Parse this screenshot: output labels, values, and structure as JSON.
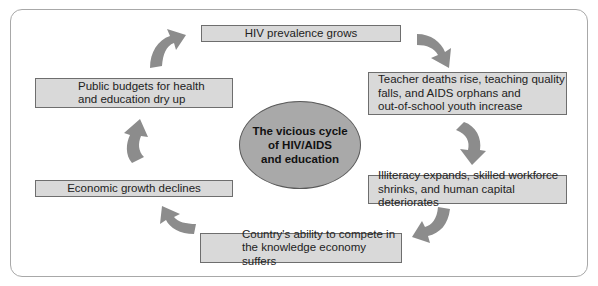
{
  "diagram": {
    "title": "The vicious cycle\nof HIV/AIDS\nand education",
    "colors": {
      "box_fill": "#d9d9d9",
      "box_border": "#6e6e6e",
      "ellipse_fill": "#a9a9a9",
      "arrow_fill": "#8c8c8c",
      "frame_border": "#a8a8a8"
    },
    "nodes": [
      {
        "id": "hiv",
        "text": "HIV prevalence grows"
      },
      {
        "id": "teacher",
        "text": "Teacher deaths rise, teaching quality\nfalls, and AIDS orphans and\nout-of-school youth increase"
      },
      {
        "id": "illiteracy",
        "text": "Illiteracy expands, skilled workforce\nshrinks, and human capital deteriorates"
      },
      {
        "id": "country",
        "text": "Country's ability to compete in\nthe knowledge economy suffers"
      },
      {
        "id": "economic",
        "text": "Economic growth declines"
      },
      {
        "id": "budgets",
        "text": "Public budgets for health\nand education dry up"
      }
    ],
    "edges": [
      {
        "from": "hiv",
        "to": "teacher",
        "icon": "curved-arrow-icon"
      },
      {
        "from": "teacher",
        "to": "illiteracy",
        "icon": "curved-arrow-icon"
      },
      {
        "from": "illiteracy",
        "to": "country",
        "icon": "curved-arrow-icon"
      },
      {
        "from": "country",
        "to": "economic",
        "icon": "curved-arrow-icon"
      },
      {
        "from": "economic",
        "to": "budgets",
        "icon": "curved-arrow-icon"
      },
      {
        "from": "budgets",
        "to": "hiv",
        "icon": "curved-arrow-icon"
      }
    ]
  }
}
